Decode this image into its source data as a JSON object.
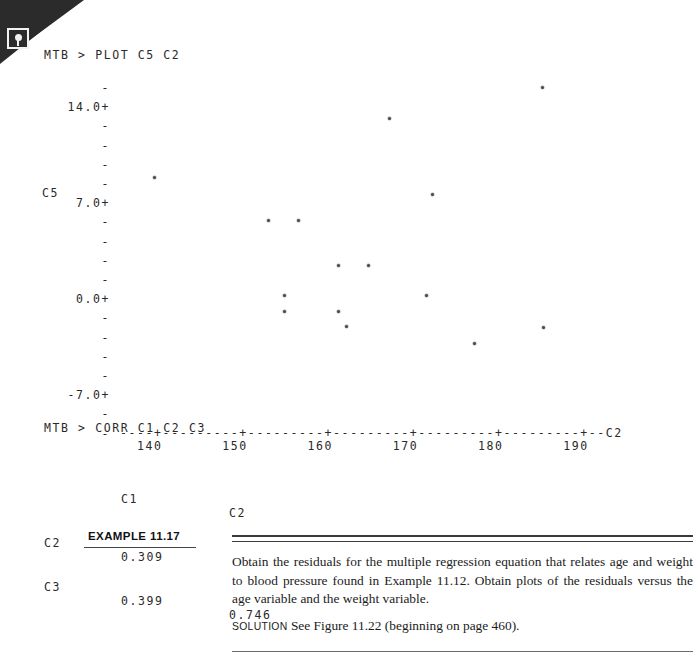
{
  "page": {
    "corner_icon": "scan-marker-icon"
  },
  "terminal": {
    "plot_command": "MTB > PLOT C5 C2",
    "corr_command": "MTB > CORR C1 C2 C3"
  },
  "corr_table": {
    "col_headers": [
      "C1",
      "C2"
    ],
    "rows": [
      {
        "label": "C2",
        "c1": "0.309",
        "c2": ""
      },
      {
        "label": "C3",
        "c1": "0.399",
        "c2": "0.746"
      }
    ]
  },
  "example": {
    "tag": "EXAMPLE 11.17",
    "body": "Obtain the residuals for the multiple regression equation that relates age and weight to blood pressure found in Example 11.12. Obtain plots of the residuals versus the age variable and the weight variable.",
    "solution_label": "SOLUTION",
    "solution_text": "See Figure 11.22 (beginning on page 460)."
  },
  "chart_data": {
    "type": "scatter",
    "title": "",
    "xlabel": "C2",
    "ylabel": "C5",
    "xlim": [
      136,
      194
    ],
    "ylim": [
      -10.5,
      15.5
    ],
    "grid": false,
    "legend": null,
    "x_tick_labels": [
      "140",
      "150",
      "160",
      "170",
      "180",
      "190"
    ],
    "x_ticks": [
      140,
      150,
      160,
      170,
      180,
      190
    ],
    "y_tick_labels": [
      "14.0+",
      "7.0+",
      "0.0+",
      "-7.0+"
    ],
    "y_ticks": [
      14.0,
      7.0,
      0.0,
      -7.0
    ],
    "y_axis_line": "-\n14.0+\n-\n-\n-\n-\n7.0+\n-\n-\n-\n-\n0.0+\n-\n-\n-\n-\n-7.0+\n-\n-",
    "x_axis_line": "----+---------+---------+---------+---------+---------+--C2",
    "x_tick_label_row": "  140       150       160       170       180       190",
    "points": [
      {
        "x": 190.3,
        "y": 15.1
      },
      {
        "x": 170.5,
        "y": 12.3
      },
      {
        "x": 176.0,
        "y": 5.3
      },
      {
        "x": 139.9,
        "y": 6.9
      },
      {
        "x": 154.7,
        "y": 3.0
      },
      {
        "x": 158.7,
        "y": 3.0
      },
      {
        "x": 163.8,
        "y": -1.1
      },
      {
        "x": 167.7,
        "y": -1.1
      },
      {
        "x": 156.8,
        "y": -3.9
      },
      {
        "x": 175.2,
        "y": -3.9
      },
      {
        "x": 156.8,
        "y": -5.3
      },
      {
        "x": 163.8,
        "y": -5.3
      },
      {
        "x": 164.9,
        "y": -6.7
      },
      {
        "x": 190.5,
        "y": -6.8
      },
      {
        "x": 181.5,
        "y": -8.3
      }
    ]
  }
}
